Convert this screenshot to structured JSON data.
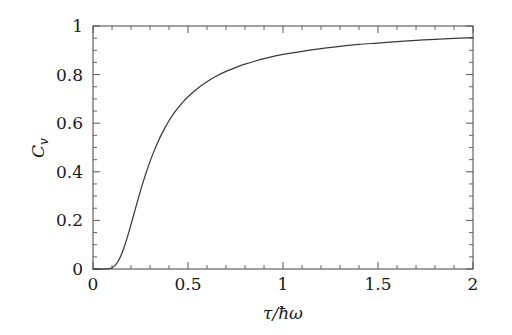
{
  "chart_data": {
    "type": "line",
    "title": "",
    "subtitle": "",
    "xlabel": "τ/ħω",
    "ylabel": "C",
    "ylabel_sub": "v",
    "ylabel_full": "C_v",
    "xlim": [
      0,
      2
    ],
    "ylim": [
      0,
      1
    ],
    "x_ticks": [
      0,
      0.5,
      1,
      1.5,
      2
    ],
    "x_tick_labels": [
      "0",
      "0.5",
      "1",
      "1.5",
      "2"
    ],
    "x_minor_step": 0.1,
    "y_ticks": [
      0,
      0.2,
      0.4,
      0.6,
      0.8,
      1
    ],
    "y_tick_labels": [
      "0",
      "0.2",
      "0.4",
      "0.6",
      "0.8",
      "1"
    ],
    "y_minor_step": 0.05,
    "grid": false,
    "legend": null,
    "legend_position": "none",
    "line_color": "#3a3a3a",
    "frame_color": "#555555",
    "background_color": "#ffffff",
    "annotations": [],
    "series": [
      {
        "name": "Einstein heat capacity",
        "x": [
          0.0,
          0.02,
          0.04,
          0.06,
          0.08,
          0.1,
          0.12,
          0.14,
          0.16,
          0.18,
          0.2,
          0.22,
          0.24,
          0.26,
          0.28,
          0.3,
          0.32,
          0.34,
          0.36,
          0.38,
          0.4,
          0.42,
          0.44,
          0.46,
          0.48,
          0.5,
          0.55,
          0.6,
          0.65,
          0.7,
          0.75,
          0.8,
          0.85,
          0.9,
          0.95,
          1.0,
          1.1,
          1.2,
          1.3,
          1.4,
          1.5,
          1.6,
          1.7,
          1.8,
          1.9,
          2.0
        ],
        "y": [
          0.0,
          0.0,
          0.0,
          0.0,
          0.001,
          0.005,
          0.018,
          0.043,
          0.081,
          0.129,
          0.183,
          0.239,
          0.295,
          0.348,
          0.397,
          0.442,
          0.483,
          0.52,
          0.553,
          0.583,
          0.61,
          0.634,
          0.656,
          0.675,
          0.693,
          0.709,
          0.743,
          0.771,
          0.794,
          0.813,
          0.829,
          0.843,
          0.855,
          0.866,
          0.875,
          0.883,
          0.896,
          0.907,
          0.916,
          0.924,
          0.93,
          0.936,
          0.941,
          0.945,
          0.949,
          0.952
        ]
      }
    ]
  },
  "figure": {
    "caption": ""
  }
}
